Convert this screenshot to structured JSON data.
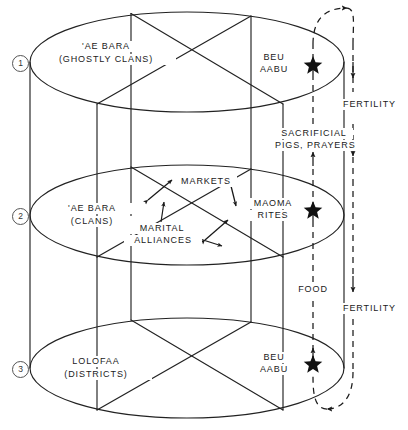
{
  "figure": {
    "type": "anthropological-diagram"
  },
  "tiers": [
    {
      "number": "1",
      "name_line1": "'AE BARA",
      "name_line2": "(GHOSTLY CLANS)",
      "ritual_line1": "BEU",
      "ritual_line2": "AABU",
      "marker": "star"
    },
    {
      "number": "2",
      "name_line1": "'AE BARA",
      "name_line2": "(CLANS)",
      "ritual_line1": "MAOMA",
      "ritual_line2": "RITES",
      "marker": "star"
    },
    {
      "number": "3",
      "name_line1": "LOLOFAA",
      "name_line2": "(DISTRICTS)",
      "ritual_line1": "BEU",
      "ritual_line2": "AABU",
      "marker": "star"
    }
  ],
  "flows": {
    "markets": "MARKETS",
    "marital_line1": "MARITAL",
    "marital_line2": "ALLIANCES",
    "sacrificial_line1": "SACRIFICIAL",
    "sacrificial_line2": "PIGS, PRAYERS",
    "food": "FOOD",
    "fertility_upper": "FERTILITY",
    "fertility_lower": "FERTILITY"
  },
  "colors": {
    "ink": "#1a1a1a",
    "line": "#222222",
    "circle_stroke": "#555555",
    "background": "#ffffff"
  }
}
